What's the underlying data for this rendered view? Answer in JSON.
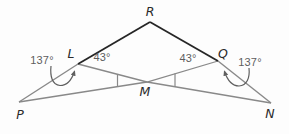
{
  "diagram": {
    "vertex_labels": {
      "R": "R",
      "L": "L",
      "Q": "Q",
      "M": "M",
      "P": "P",
      "N": "N"
    },
    "angle_labels": {
      "left_outer": "137°",
      "left_inner": "43°",
      "right_inner": "43°",
      "right_outer": "137°"
    },
    "colors": {
      "background": "#fdfdfd",
      "line": "#898989",
      "dark_line": "#262626",
      "vertex_text": "#2a2a2a",
      "angle_text": "#5d5d5d",
      "arrow": "#5f5f5f"
    }
  }
}
